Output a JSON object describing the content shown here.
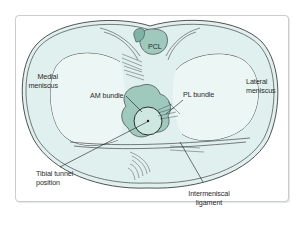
{
  "diagram": {
    "type": "anatomical-illustration",
    "colors": {
      "tissue_fill": "#dff0ee",
      "ligament_fill": "#9fc9bd",
      "ligament_dark": "#7fb3a5",
      "outline": "#2a2a2a",
      "frame_border": "#c9ccd0",
      "background": "#ffffff"
    },
    "labels": {
      "pcl": "PCL",
      "medial_meniscus_line1": "Medial",
      "medial_meniscus_line2": "meniscus",
      "lateral_meniscus_line1": "Lateral",
      "lateral_meniscus_line2": "meniscus",
      "am_bundle": "AM bundle",
      "pl_bundle": "PL bundle",
      "tibial_tunnel_line1": "Tibial tunnel",
      "tibial_tunnel_line2": "position",
      "intermeniscal_line1": "Intermeniscal",
      "intermeniscal_line2": "ligament"
    }
  }
}
